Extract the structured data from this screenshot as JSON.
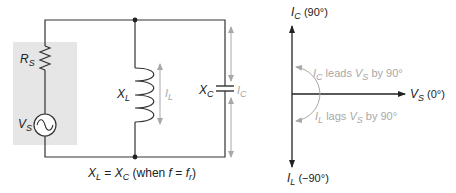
{
  "circuit": {
    "source_label": "V",
    "source_sub": "S",
    "resistor_label": "R",
    "resistor_sub": "S",
    "inductor_label": "X",
    "inductor_sub": "L",
    "inductor_current_label": "I",
    "inductor_current_sub": "L",
    "capacitor_label": "X",
    "capacitor_sub": "C",
    "capacitor_current_label": "I",
    "capacitor_current_sub": "C",
    "caption": {
      "x1": "X",
      "x1_sub": "L",
      "eq": " = ",
      "x2": "X",
      "x2_sub": "C",
      "when": " (when ",
      "f": "f",
      "eq2": " = ",
      "fr": "f",
      "fr_sub": "r",
      "close": ")"
    },
    "colors": {
      "wire": "#333333",
      "shade": "#e6e6e6",
      "arrow": "#a8a8a8"
    }
  },
  "phasor": {
    "top_label": "I",
    "top_sub": "C",
    "top_angle": " (90°)",
    "right_label": "V",
    "right_sub": "S",
    "right_angle": " (0°)",
    "bottom_label": "I",
    "bottom_sub": "L",
    "bottom_angle": " (−90°)",
    "lead_note": {
      "a": "I",
      "a_sub": "C",
      "mid": " leads ",
      "b": "V",
      "b_sub": "S",
      "end": " by 90°"
    },
    "lag_note": {
      "a": "I",
      "a_sub": "L",
      "mid": " lags ",
      "b": "V",
      "b_sub": "S",
      "end": " by 90°"
    }
  }
}
